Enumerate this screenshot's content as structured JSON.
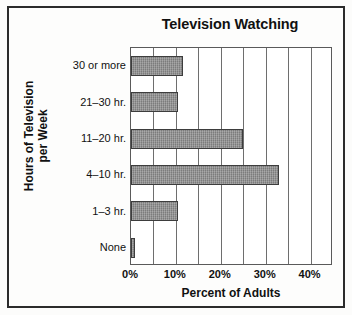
{
  "chart_data": {
    "type": "bar",
    "orientation": "horizontal",
    "title": "Television Watching",
    "xlabel": "Percent of Adults",
    "ylabel": "Hours of Television per Week",
    "ylabel_lines": [
      "Hours of Television",
      "per Week"
    ],
    "categories": [
      "30 or more",
      "21–30 hr.",
      "11–20 hr.",
      "4–10 hr.",
      "1–3 hr.",
      "None"
    ],
    "values": [
      11.5,
      10.5,
      25,
      33,
      10.5,
      1
    ],
    "xlim": [
      0,
      45
    ],
    "xticks": [
      0,
      10,
      20,
      30,
      40
    ],
    "xtick_labels": [
      "0%",
      "10%",
      "20%",
      "30%",
      "40%"
    ],
    "gridline_interval": 5,
    "gridlines": [
      5,
      10,
      15,
      20,
      25,
      30,
      35,
      40
    ],
    "grid": true,
    "legend": false,
    "bar_color": "#8b8b8b",
    "bar_edge_color": "#3d3d3d",
    "axis_color": "#5a5a5a",
    "text_color": "#111111",
    "frame_color": "#2b2b2b",
    "background": "#fdfdfc"
  }
}
